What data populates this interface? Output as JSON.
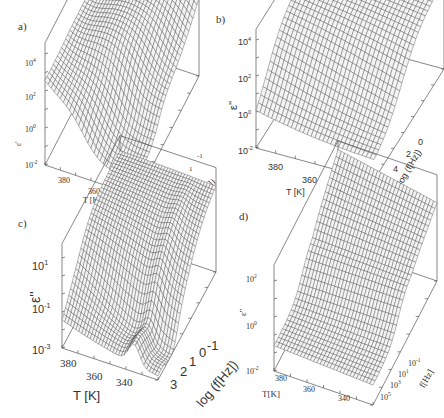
{
  "figure": {
    "panels": [
      {
        "id": "a",
        "label": "a)",
        "zlabel": "ε'",
        "xlabel": "T [K]",
        "ylabel": "log (f[Hz])"
      },
      {
        "id": "b",
        "label": "b)",
        "zlabel": "ε''",
        "xlabel": "T [K]",
        "ylabel": "log (f[Hz])"
      },
      {
        "id": "c",
        "label": "c)",
        "zlabel": "ε''",
        "xlabel": "T [K]",
        "ylabel": "log (f[Hz])"
      },
      {
        "id": "d",
        "label": "d)",
        "zlabel": "ε''",
        "xlabel": "T[K]",
        "ylabel": "f[Hz]"
      }
    ]
  },
  "chart_data": [
    {
      "panel": "a)",
      "type": "surface",
      "title": "",
      "xlabel": "T [K]",
      "ylabel": "log (f[Hz])",
      "zlabel": "ε'",
      "x_ticks": [
        "380",
        "360",
        "340"
      ],
      "y_ticks": [
        "-1",
        "1",
        "3",
        "5"
      ],
      "z_ticks": [
        "10^-2",
        "10^0",
        "10^2",
        "10^4"
      ],
      "z_scale": "log",
      "xlim": [
        335,
        390
      ],
      "ylim": [
        -1,
        6
      ],
      "zlim": [
        -2,
        4.5
      ],
      "description": "Real permittivity: low plateau (~10^-1) at high T, steep rise to ~10^4 at low frequency and low T; step near 10^0 at mid frequencies"
    },
    {
      "panel": "b)",
      "type": "surface",
      "title": "",
      "xlabel": "T [K]",
      "ylabel": "log (f[Hz])",
      "zlabel": "ε''",
      "x_ticks": [
        "380",
        "360",
        "340"
      ],
      "y_ticks": [
        "0",
        "2",
        "4",
        "6"
      ],
      "z_ticks": [
        "10^-2",
        "10^0",
        "10^2",
        "10^4"
      ],
      "z_scale": "log",
      "xlim": [
        335,
        390
      ],
      "ylim": [
        -1,
        6.5
      ],
      "zlim": [
        -2,
        4.5
      ],
      "description": "Loss: ridge rising to ~10^4 at low frequency; near 10^-1 at high frequencies"
    },
    {
      "panel": "c)",
      "type": "surface",
      "title": "",
      "xlabel": "T [K]",
      "ylabel": "log (f[Hz])",
      "zlabel": "ε''",
      "x_ticks": [
        "380",
        "360",
        "340"
      ],
      "y_ticks": [
        "3",
        "2",
        "1",
        "0",
        "-1"
      ],
      "z_ticks": [
        "10^-3",
        "10^-1",
        "10^1"
      ],
      "z_scale": "log",
      "xlim": [
        335,
        390
      ],
      "ylim": [
        -1.5,
        3.5
      ],
      "zlim": [
        -3,
        2.5
      ],
      "description": "Loss (derived): peak ~10^2 at low frequency, falling to ~10^-3 with a dip and secondary ridge"
    },
    {
      "panel": "d)",
      "type": "surface",
      "title": "",
      "xlabel": "T[K]",
      "ylabel": "f[Hz]",
      "zlabel": "ε''",
      "x_ticks": [
        "380",
        "360",
        "340"
      ],
      "y_ticks": [
        "10^5",
        "10^3",
        "10^1",
        "10^-1"
      ],
      "z_ticks": [
        "10^-2",
        "10^0",
        "10^2"
      ],
      "z_scale": "log",
      "xlim": [
        335,
        390
      ],
      "ylim": [
        -1,
        6
      ],
      "zlim": [
        -2,
        3.5
      ],
      "description": "Model fit: smooth sigmoidal surface, ~10^0 plateau at high frequency to ~10^2 at low frequency, rising toward ~10^3"
    }
  ]
}
